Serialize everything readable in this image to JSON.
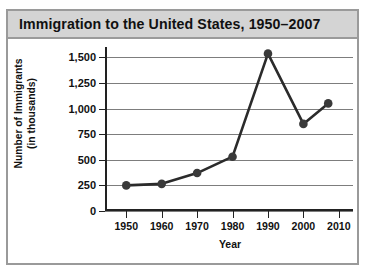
{
  "figure": {
    "title": "Immigration to the United States, 1950–2007"
  },
  "chart_data": {
    "type": "line",
    "title": "Immigration to the United States, 1950–2007",
    "xlabel": "Year",
    "ylabel": "Number of Immigrants (in thousands)",
    "ylabel_line1": "Number of Immigrants",
    "ylabel_line2": "(in thousands)",
    "x": [
      1950,
      1960,
      1970,
      1980,
      1990,
      2000,
      2007
    ],
    "values": [
      250,
      265,
      370,
      530,
      1535,
      850,
      1050
    ],
    "xlim": [
      1944,
      2014
    ],
    "ylim": [
      0,
      1600
    ],
    "xticks": [
      1950,
      1960,
      1970,
      1980,
      1990,
      2000,
      2010
    ],
    "xtick_labels": [
      "1950",
      "1960",
      "1970",
      "1980",
      "1990",
      "2000",
      "2010"
    ],
    "yticks": [
      0,
      250,
      500,
      750,
      1000,
      1250,
      1500
    ],
    "ytick_labels": [
      "0",
      "250",
      "500",
      "750",
      "1,000",
      "1,250",
      "1,500"
    ],
    "grid": "horizontal",
    "legend": null,
    "marker": "circle",
    "line_color": "#2b2b2b",
    "marker_color": "#3a3a3a",
    "grid_color": "#7d7d7d",
    "title_bar_color": "#d4d4d4",
    "border_color": "#9a9a9a",
    "plot_background": "#ffffff"
  }
}
